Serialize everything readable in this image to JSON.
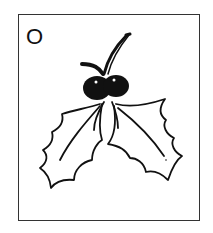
{
  "card": {
    "letter": "O",
    "illustration": "holly-icon",
    "colors": {
      "ink": "#111111",
      "paper": "#ffffff",
      "border": "#333333"
    }
  }
}
